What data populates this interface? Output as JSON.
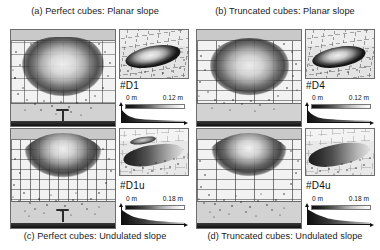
{
  "figure": {
    "panel_count": 4
  },
  "panels": [
    {
      "id": "a",
      "caption": "(a) Perfect cubes: Planar slope",
      "caption_position": "top",
      "deposit_label": "#D1",
      "colorbar": {
        "min_label": "0 m",
        "max_label": "0.12 m",
        "min_value": 0,
        "max_value": 0.12,
        "units": "m",
        "colormap": "grayscale-dark-to-light"
      },
      "views": {
        "plan": "plan-view-grid",
        "perspective": "3d-perspective-inset",
        "profile": "side-profile-thickness"
      }
    },
    {
      "id": "b",
      "caption": "(b) Truncated cubes: Planar slope",
      "caption_position": "top",
      "deposit_label": "#D4",
      "colorbar": {
        "min_label": "0 m",
        "max_label": "0.12 m",
        "min_value": 0,
        "max_value": 0.12,
        "units": "m",
        "colormap": "grayscale-dark-to-light"
      },
      "views": {
        "plan": "plan-view-grid",
        "perspective": "3d-perspective-inset",
        "profile": "side-profile-thickness"
      }
    },
    {
      "id": "c",
      "caption": "(c) Perfect cubes: Undulated slope",
      "caption_position": "bottom",
      "deposit_label": "#D1u",
      "colorbar": {
        "min_label": "0 m",
        "max_label": "0.18 m",
        "min_value": 0,
        "max_value": 0.18,
        "units": "m",
        "colormap": "grayscale-dark-to-light"
      },
      "views": {
        "plan": "plan-view-grid",
        "perspective": "3d-perspective-inset",
        "profile": "side-profile-thickness"
      }
    },
    {
      "id": "d",
      "caption": "(d) Truncated cubes: Undulated slope",
      "caption_position": "bottom",
      "deposit_label": "#D4u",
      "colorbar": {
        "min_label": "0 m",
        "max_label": "0.18 m",
        "min_value": 0,
        "max_value": 0.18,
        "units": "m",
        "colormap": "grayscale-dark-to-light"
      },
      "views": {
        "plan": "plan-view-grid",
        "perspective": "3d-perspective-inset",
        "profile": "side-profile-thickness"
      }
    }
  ],
  "colors": {
    "background": "#ffffff",
    "text": "#1b1b1b",
    "panel_border": "#6d6d6d",
    "grid": "#3c3c3c",
    "axis": "#111111",
    "colorbar_low": "#111111",
    "colorbar_high": "#ffffff"
  }
}
